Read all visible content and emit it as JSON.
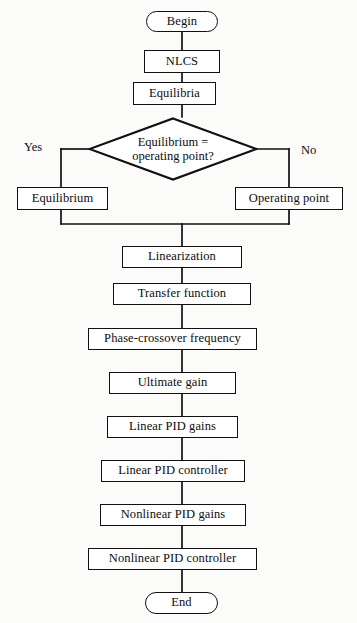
{
  "diagram": {
    "colors": {
      "background": "#fbfbfa",
      "stroke": "#111111",
      "fill": "#ffffff",
      "text": "#0d0d0d"
    },
    "start": {
      "label": "Begin"
    },
    "end": {
      "label": "End"
    },
    "decision": {
      "line1": "Equilibrium =",
      "line2": "operating point?",
      "yes_label": "Yes",
      "no_label": "No"
    },
    "branches": {
      "yes_node": "Equilibrium",
      "no_node": "Operating point"
    },
    "preface": [
      {
        "label": "NLCS"
      },
      {
        "label": "Equilibria"
      }
    ],
    "sequence": [
      {
        "label": "Linearization"
      },
      {
        "label": "Transfer function"
      },
      {
        "label": "Phase-crossover frequency"
      },
      {
        "label": "Ultimate gain"
      },
      {
        "label": "Linear PID gains"
      },
      {
        "label": "Linear PID controller"
      },
      {
        "label": "Nonlinear PID gains"
      },
      {
        "label": "Nonlinear PID controller"
      }
    ]
  }
}
